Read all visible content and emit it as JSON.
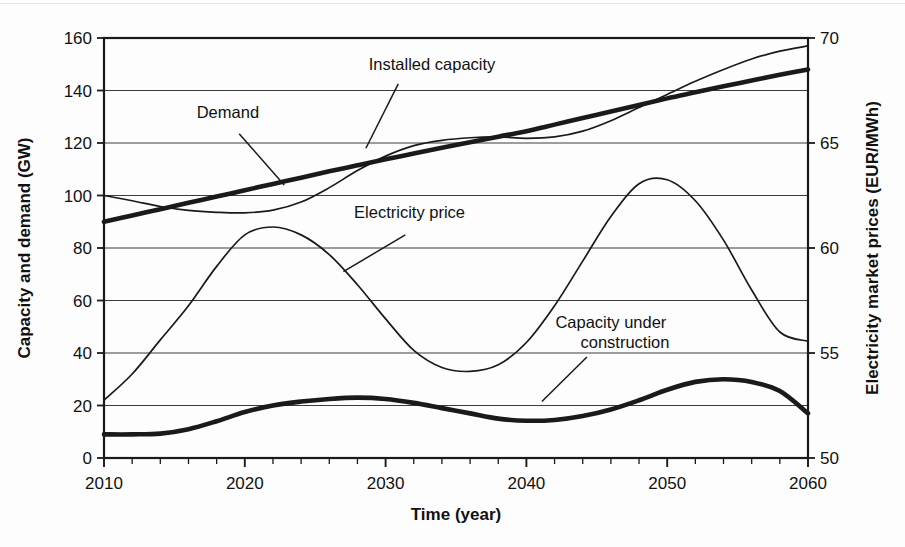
{
  "chart_data": {
    "type": "line",
    "title": "",
    "xlabel": "Time (year)",
    "ylabel": "Capacity and demand (GW)",
    "y2label": "Electricity market prices (EUR/MWh)",
    "xlim": [
      2010,
      2060
    ],
    "ylim": [
      0,
      160
    ],
    "y2lim": [
      50,
      70
    ],
    "xticks": [
      2010,
      2020,
      2030,
      2040,
      2050,
      2060
    ],
    "xtick_labels": [
      "2010",
      "2020",
      "2030",
      "2040",
      "2050",
      "2060"
    ],
    "xminor_step": 2,
    "yticks": [
      0,
      20,
      40,
      60,
      80,
      100,
      120,
      140,
      160
    ],
    "ytick_labels": [
      "0",
      "20",
      "40",
      "60",
      "80",
      "100",
      "120",
      "140",
      "160"
    ],
    "y2ticks": [
      50,
      55,
      60,
      65,
      70
    ],
    "y2tick_labels": [
      "50",
      "55",
      "60",
      "65",
      "70"
    ],
    "grid": "horizontal",
    "legend_position": "inline-annotations",
    "series": [
      {
        "name": "Installed capacity",
        "axis": "left",
        "style": "thin-solid",
        "x": [
          2010,
          2012,
          2014,
          2016,
          2018,
          2020,
          2022,
          2024,
          2026,
          2028,
          2030,
          2032,
          2034,
          2036,
          2038,
          2040,
          2042,
          2044,
          2046,
          2048,
          2050,
          2052,
          2054,
          2056,
          2058,
          2060
        ],
        "values": [
          100.0,
          98.0,
          95.8,
          94.3,
          93.6,
          93.4,
          94.4,
          97.5,
          103.0,
          109.5,
          115.0,
          119.0,
          121.0,
          122.0,
          122.3,
          121.8,
          122.3,
          124.5,
          128.5,
          133.5,
          138.5,
          143.5,
          148.0,
          152.0,
          155.0,
          157.0
        ]
      },
      {
        "name": "Demand",
        "axis": "left",
        "style": "thick-solid",
        "x": [
          2010,
          2012,
          2014,
          2016,
          2018,
          2020,
          2022,
          2024,
          2026,
          2028,
          2030,
          2032,
          2034,
          2036,
          2038,
          2040,
          2042,
          2044,
          2046,
          2048,
          2050,
          2052,
          2054,
          2056,
          2058,
          2060
        ],
        "values": [
          90.0,
          92.4,
          94.8,
          97.2,
          99.6,
          102.0,
          104.4,
          106.8,
          109.2,
          111.5,
          113.8,
          116.0,
          118.2,
          120.3,
          122.4,
          124.5,
          127.0,
          129.5,
          132.0,
          134.5,
          137.0,
          139.3,
          141.6,
          143.8,
          146.0,
          148.0
        ]
      },
      {
        "name": "Electricity price",
        "axis": "right",
        "style": "thin-solid",
        "x": [
          2010,
          2012,
          2014,
          2016,
          2018,
          2020,
          2022,
          2024,
          2026,
          2028,
          2030,
          2032,
          2034,
          2036,
          2038,
          2040,
          2042,
          2044,
          2046,
          2048,
          2050,
          2052,
          2054,
          2056,
          2058,
          2060
        ],
        "values_gw": [
          22.0,
          32.0,
          45.0,
          58.0,
          73.0,
          85.0,
          88.0,
          85.0,
          77.5,
          66.0,
          53.0,
          41.0,
          34.5,
          33.0,
          35.5,
          44.0,
          58.0,
          75.0,
          92.0,
          104.5,
          106.0,
          98.0,
          83.0,
          64.0,
          48.0,
          44.5
        ],
        "values": [
          52.75,
          54.0,
          55.6,
          57.25,
          59.1,
          60.6,
          61.0,
          60.6,
          59.7,
          58.25,
          56.6,
          55.1,
          54.3,
          54.1,
          54.4,
          55.5,
          57.25,
          59.4,
          61.5,
          63.05,
          63.25,
          62.25,
          60.4,
          58.0,
          56.0,
          55.55
        ]
      },
      {
        "name": "Capacity under construction",
        "axis": "left",
        "style": "thick-solid",
        "x": [
          2010,
          2012,
          2014,
          2016,
          2018,
          2020,
          2022,
          2024,
          2026,
          2028,
          2030,
          2032,
          2034,
          2036,
          2038,
          2040,
          2042,
          2044,
          2046,
          2048,
          2050,
          2052,
          2054,
          2056,
          2058,
          2060
        ],
        "values": [
          9.0,
          9.0,
          9.3,
          11.0,
          14.0,
          17.5,
          20.0,
          21.5,
          22.5,
          23.0,
          22.5,
          21.0,
          19.0,
          17.0,
          15.0,
          14.2,
          14.5,
          16.0,
          18.5,
          22.0,
          26.0,
          29.0,
          30.0,
          29.0,
          25.5,
          17.0
        ]
      }
    ],
    "annotations": [
      {
        "text": "Demand",
        "label_x": 2018.8,
        "label_y": 129.5,
        "leader_from": [
          2019.6,
          123.5
        ],
        "leader_to": [
          2022.8,
          104.0
        ]
      },
      {
        "text": "Installed capacity",
        "label_x": 2033.3,
        "label_y": 148.0,
        "leader_from": [
          2030.9,
          142.5
        ],
        "leader_to": [
          2028.6,
          118.0
        ]
      },
      {
        "text": "Electricity price",
        "label_x": 2031.7,
        "label_y": 91.5,
        "leader_from": [
          2031.4,
          85.0
        ],
        "leader_to": [
          2027.0,
          71.0
        ]
      },
      {
        "text": "Capacity under",
        "label_x": 2046.0,
        "label_y": 49.5,
        "leader_from": [
          2044.3,
          38.5
        ],
        "leader_to": [
          2041.1,
          21.5
        ]
      },
      {
        "text": "construction",
        "label_x": 2047.0,
        "label_y": 42.0
      }
    ]
  }
}
